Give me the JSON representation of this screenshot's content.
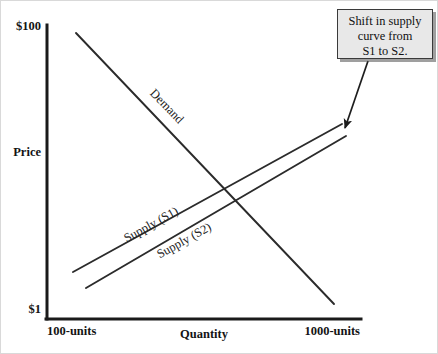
{
  "figure": {
    "background_color": "#ffffff",
    "line_color": "#2b2b2b"
  },
  "axes": {
    "y_axis": {
      "label": "Price",
      "top_tick": "$100",
      "bottom_tick": "$1"
    },
    "x_axis": {
      "label": "Quantity",
      "left_tick": "100-units",
      "right_tick": "1000-units"
    }
  },
  "curves": [
    {
      "name": "demand",
      "label": "Demand",
      "direction": "downward-sloping",
      "x1": 75,
      "y1": 32,
      "x2": 333,
      "y2": 303,
      "label_x": 163,
      "label_y": 108,
      "label_rotation": 46
    },
    {
      "name": "supply-s1",
      "label": "Supply (S1)",
      "direction": "upward-sloping",
      "x1": 72,
      "y1": 271,
      "x2": 341,
      "y2": 123,
      "label_x": 152,
      "label_y": 227,
      "label_rotation": -29
    },
    {
      "name": "supply-s2",
      "label": "Supply (S2)",
      "direction": "upward-sloping",
      "x1": 85,
      "y1": 287,
      "x2": 345,
      "y2": 135,
      "label_x": 185,
      "label_y": 243,
      "label_rotation": -29
    }
  ],
  "callout": {
    "text": "Shift in supply\ncurve from\nS1 to S2.",
    "fill_color": "#e8e8e8",
    "border_color": "#3a3a3a",
    "x": 336,
    "y": 8,
    "width": 96,
    "height": 50
  },
  "arrow": {
    "name": "callout-arrow",
    "from_x": 367,
    "from_y": 60,
    "to_x": 344,
    "to_y": 127
  },
  "chart_data": {
    "type": "line",
    "title": "Shift in supply curve from S1 to S2",
    "xlabel": "Quantity",
    "ylabel": "Price",
    "xticklabels": [
      "100-units",
      "1000-units"
    ],
    "yticklabels": [
      "$1",
      "$100"
    ],
    "xlim": [
      100,
      1000
    ],
    "ylim": [
      1,
      100
    ],
    "grid": false,
    "legend": "inline-labels",
    "series": [
      {
        "name": "Demand",
        "x": [
          100,
          1000
        ],
        "y": [
          100,
          6
        ],
        "note": "Downward-sloping demand curve from top-left to bottom-right"
      },
      {
        "name": "Supply (S1)",
        "x": [
          100,
          1000
        ],
        "y": [
          17,
          69
        ],
        "note": "Original upward-sloping supply curve"
      },
      {
        "name": "Supply (S2)",
        "x": [
          145,
          1000
        ],
        "y": [
          11,
          65
        ],
        "note": "Shifted supply curve, parallel and below/right of S1"
      }
    ],
    "annotations": [
      {
        "text": "Shift in supply curve from S1 to S2.",
        "points_to": "Supply (S1) right endpoint"
      }
    ]
  }
}
